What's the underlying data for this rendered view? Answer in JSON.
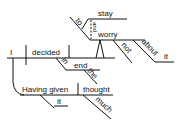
{
  "diagram": {
    "type": "sentence-diagram",
    "words": {
      "subject": "I",
      "verb": "decided",
      "infinitive_marker": "to",
      "infinitive_verb_1": "stay",
      "conjunction": "and",
      "infinitive_verb_2": "worry",
      "negation": "not",
      "preposition_about": "about",
      "object_about": "it",
      "preposition_in": "in",
      "object_in": "end",
      "article": "the",
      "participle": "Having given",
      "participle_object": "thought",
      "indirect_object": "it",
      "modifier_much": "much"
    },
    "colors": {
      "line": "#111111",
      "text": "#111111",
      "background": "#ffffff"
    }
  }
}
